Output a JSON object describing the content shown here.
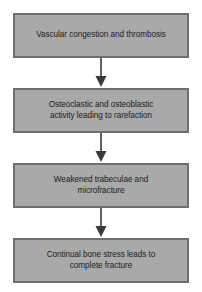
{
  "diagram": {
    "type": "flowchart",
    "orientation": "vertical-top-to-bottom",
    "background_color": "#ffffff",
    "node_fill_color": "#a9a9a9",
    "node_border_color": "#6e6e6e",
    "text_color": "#1c1c1c",
    "arrow_color": "#3a3a3a",
    "nodes": [
      {
        "id": "node-1",
        "label": "Vascular congestion and thrombosis"
      },
      {
        "id": "node-2",
        "label": "Osteoclastic and osteoblastic\nactivity leading to rarefaction"
      },
      {
        "id": "node-3",
        "label": "Weakened trabeculae and\nmicrofracture"
      },
      {
        "id": "node-4",
        "label": "Continual bone stress leads to\ncomplete fracture"
      }
    ],
    "connectors": [
      {
        "id": "connector-1",
        "from": "node-1",
        "to": "node-2",
        "icon": "arrow-down-icon"
      },
      {
        "id": "connector-2",
        "from": "node-2",
        "to": "node-3",
        "icon": "arrow-down-icon"
      },
      {
        "id": "connector-3",
        "from": "node-3",
        "to": "node-4",
        "icon": "arrow-down-icon"
      }
    ]
  }
}
